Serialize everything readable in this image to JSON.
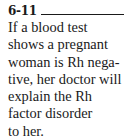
{
  "item": {
    "number": "6-11",
    "lines": [
      "If a blood test",
      "shows a pregnant",
      "woman is Rh nega-",
      "tive, her doctor will",
      "explain the Rh",
      "factor disorder",
      "to her."
    ]
  }
}
